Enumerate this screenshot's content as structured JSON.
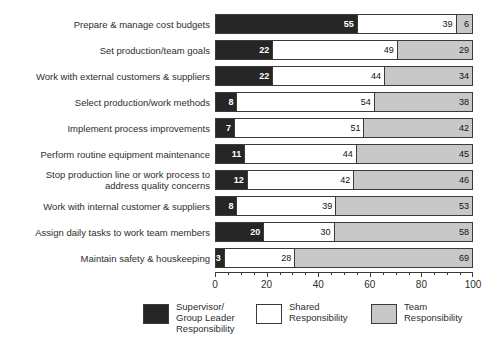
{
  "chart": {
    "title": "",
    "type": "stacked-bar-horizontal"
  },
  "axis": {
    "tick_labels": [
      "0",
      "20",
      "40",
      "60",
      "80",
      "100"
    ],
    "min": 0,
    "max": 100,
    "major_step": 20,
    "minor_step": 5
  },
  "legend": {
    "items": [
      {
        "label": "Supervisor/\nGroup Leader\nResponsibility",
        "color": "#262626",
        "name": "supervisor-group-leader-responsibility"
      },
      {
        "label": "Shared\nResponsibility",
        "color": "#ffffff",
        "name": "shared-responsibility"
      },
      {
        "label": "Team\nResponsibility",
        "color": "#c8c8c8",
        "name": "team-responsibility"
      }
    ]
  },
  "rows": [
    {
      "label": "Prepare & manage cost budgets",
      "values": [
        55,
        39,
        6
      ]
    },
    {
      "label": "Set production/team goals",
      "values": [
        22,
        49,
        29
      ]
    },
    {
      "label": "Work with external customers & suppliers",
      "values": [
        22,
        44,
        34
      ]
    },
    {
      "label": "Select production/work methods",
      "values": [
        8,
        54,
        38
      ]
    },
    {
      "label": "Implement process improvements",
      "values": [
        7,
        51,
        42
      ]
    },
    {
      "label": "Perform routine equipment maintenance",
      "values": [
        11,
        44,
        45
      ]
    },
    {
      "label": "Stop production line or work process to\naddress quality concerns",
      "values": [
        12,
        42,
        46
      ]
    },
    {
      "label": "Work with internal customer & suppliers",
      "values": [
        8,
        39,
        53
      ]
    },
    {
      "label": "Assign daily tasks to work team members",
      "values": [
        20,
        30,
        58
      ]
    },
    {
      "label": "Maintain safety & houskeeping",
      "values": [
        3,
        28,
        69
      ]
    }
  ],
  "chart_data": {
    "type": "bar",
    "orientation": "horizontal",
    "stacked": true,
    "title": "",
    "xlabel": "",
    "ylabel": "",
    "xlim": [
      0,
      100
    ],
    "xticks": [
      0,
      20,
      40,
      60,
      80,
      100
    ],
    "grid": false,
    "legend_position": "bottom",
    "categories": [
      "Prepare & manage cost budgets",
      "Set production/team goals",
      "Work with external customers & suppliers",
      "Select production/work methods",
      "Implement process improvements",
      "Perform routine equipment maintenance",
      "Stop production line or work process to address quality concerns",
      "Work with internal customer & suppliers",
      "Assign daily tasks to work team members",
      "Maintain safety & houskeeping"
    ],
    "series": [
      {
        "name": "Supervisor/Group Leader Responsibility",
        "color": "#262626",
        "values": [
          55,
          22,
          22,
          8,
          7,
          11,
          12,
          8,
          20,
          3
        ]
      },
      {
        "name": "Shared Responsibility",
        "color": "#ffffff",
        "values": [
          39,
          49,
          44,
          54,
          51,
          44,
          42,
          39,
          30,
          28
        ]
      },
      {
        "name": "Team Responsibility",
        "color": "#c8c8c8",
        "values": [
          6,
          29,
          34,
          38,
          42,
          45,
          46,
          53,
          58,
          69
        ]
      }
    ]
  }
}
